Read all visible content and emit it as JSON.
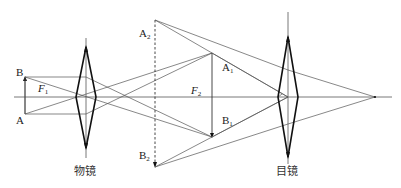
{
  "diagram": {
    "colors": {
      "line": "#555555",
      "lens": "#111111",
      "background": "#ffffff"
    },
    "optical_axis": {
      "y": 97,
      "x_start": 14,
      "x_end": 392
    },
    "lenses": [
      {
        "id": "objective",
        "caption": "物镜",
        "x": 86,
        "top": 47,
        "bottom": 148,
        "half_width": 10
      },
      {
        "id": "eyepiece",
        "caption": "目镜",
        "x": 288,
        "top": 37,
        "bottom": 157,
        "half_width": 10
      }
    ],
    "labels": {
      "B": {
        "main": "B",
        "sub": ""
      },
      "A": {
        "main": "A",
        "sub": ""
      },
      "F1": {
        "main": "F",
        "sub": "1"
      },
      "F2": {
        "main": "F",
        "sub": "2"
      },
      "A1": {
        "main": "A",
        "sub": "1"
      },
      "B1": {
        "main": "B",
        "sub": "1"
      },
      "A2": {
        "main": "A",
        "sub": "2"
      },
      "B2": {
        "main": "B",
        "sub": "2"
      }
    },
    "captions": {
      "objective": "物镜",
      "eyepiece": "目镜"
    },
    "objects": {
      "AB": {
        "x": 25,
        "A_y": 114,
        "B_y": 77
      },
      "A1B1": {
        "x": 212,
        "A1_y": 53,
        "B1_y": 137
      },
      "A2B2": {
        "x": 155,
        "A2_y": 20,
        "B2_y": 167,
        "dashed": true
      }
    },
    "focal_points": {
      "F1": {
        "x": 46,
        "y": 97
      },
      "F2": {
        "x": 212,
        "y": 97
      },
      "eye_focus": {
        "x": 375,
        "y": 97
      }
    }
  }
}
